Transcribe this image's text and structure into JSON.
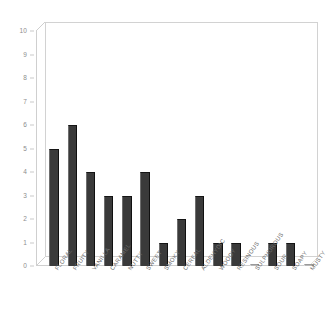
{
  "chart_data": {
    "type": "bar",
    "title": "",
    "subtitle": "",
    "xlabel": "",
    "ylabel": "",
    "ylim": [
      0,
      10
    ],
    "ytick_step": 1,
    "yticks": [
      0,
      1,
      2,
      3,
      4,
      5,
      6,
      7,
      8,
      9,
      10
    ],
    "grid": false,
    "legend": "none",
    "bar_color": "#3a3a3a",
    "zero_bar_color": "#b9b9b9",
    "axis_color": "#cfcfcf",
    "tick_label_color": "#8d8d8d",
    "categories": [
      "FLORAL",
      "FRUITY",
      "VANILLA",
      "CARAMEL",
      "NUTTY",
      "SWEET",
      "SMOKY",
      "CEREAL",
      "ALDEHYDIC",
      "WOODY",
      "RESINOUS",
      "SULPHUROUS",
      "SOUR",
      "SOAPY",
      "MUSTY"
    ],
    "values": [
      5,
      6,
      4,
      3,
      3,
      4,
      1,
      2,
      3,
      1,
      1,
      0,
      1,
      1,
      0
    ]
  }
}
